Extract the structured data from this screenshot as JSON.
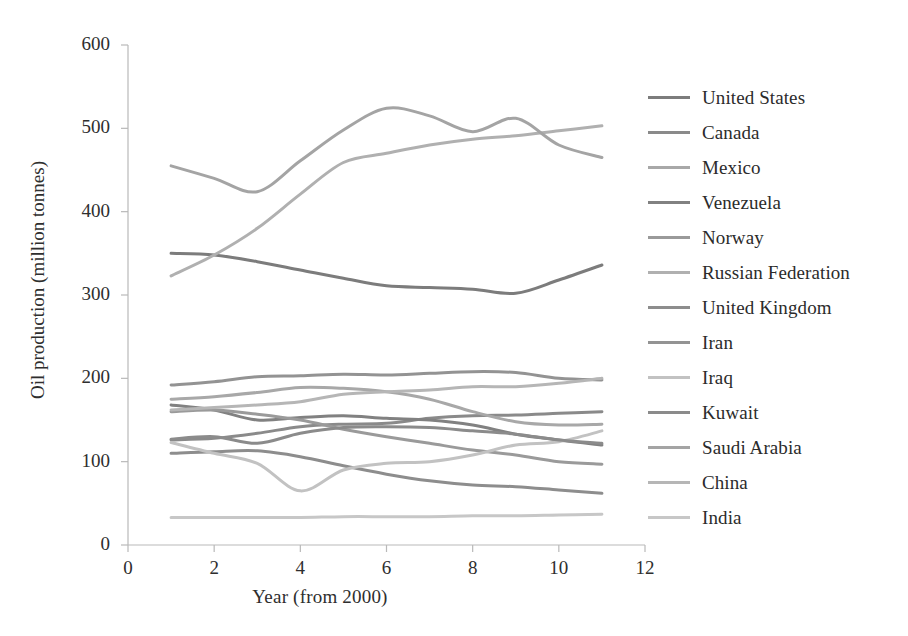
{
  "chart_data": {
    "type": "line",
    "title": "",
    "subtitle": "",
    "xlabel": "Year (from 2000)",
    "ylabel": "Oil production (million tonnes)",
    "xlim": [
      0,
      12
    ],
    "ylim": [
      0,
      600
    ],
    "xticks": [
      0,
      2,
      4,
      6,
      8,
      10,
      12
    ],
    "yticks": [
      0,
      100,
      200,
      300,
      400,
      500,
      600
    ],
    "grid": false,
    "legend_position": "right",
    "x": [
      1,
      2,
      3,
      4,
      5,
      6,
      7,
      8,
      9,
      10,
      11
    ],
    "series": [
      {
        "name": "United States",
        "color": "#7c7c7c",
        "values": [
          350,
          348,
          340,
          330,
          320,
          311,
          309,
          307,
          302,
          318,
          336
        ]
      },
      {
        "name": "Canada",
        "color": "#8a8a8a",
        "values": [
          126,
          128,
          134,
          142,
          145,
          146,
          152,
          155,
          156,
          158,
          160
        ]
      },
      {
        "name": "Mexico",
        "color": "#a8a8a8",
        "values": [
          175,
          178,
          183,
          189,
          188,
          184,
          175,
          160,
          148,
          144,
          145
        ]
      },
      {
        "name": "Venezuela",
        "color": "#818181",
        "values": [
          168,
          162,
          150,
          153,
          155,
          152,
          150,
          144,
          133,
          126,
          120
        ]
      },
      {
        "name": "Norway",
        "color": "#9a9a9a",
        "values": [
          160,
          162,
          157,
          150,
          139,
          130,
          122,
          114,
          108,
          100,
          97
        ]
      },
      {
        "name": "Russian Federation",
        "color": "#b0b0b0",
        "values": [
          323,
          348,
          380,
          421,
          459,
          470,
          480,
          487,
          491,
          497,
          503
        ]
      },
      {
        "name": "United Kingdom",
        "color": "#8d8d8d",
        "values": [
          110,
          112,
          113,
          106,
          95,
          85,
          77,
          72,
          70,
          66,
          62
        ]
      },
      {
        "name": "Iran",
        "color": "#939393",
        "values": [
          192,
          196,
          202,
          203,
          205,
          204,
          206,
          208,
          207,
          200,
          198
        ]
      },
      {
        "name": "Iraq",
        "color": "#c2c2c2",
        "values": [
          123,
          110,
          98,
          65,
          90,
          98,
          100,
          108,
          120,
          124,
          137
        ]
      },
      {
        "name": "Kuwait",
        "color": "#8b8b8b",
        "values": [
          127,
          130,
          122,
          134,
          141,
          142,
          141,
          137,
          133,
          126,
          122
        ]
      },
      {
        "name": "Saudi Arabia",
        "color": "#a4a4a4",
        "values": [
          455,
          440,
          424,
          461,
          498,
          524,
          515,
          496,
          512,
          480,
          465
        ]
      },
      {
        "name": "China",
        "color": "#b6b6b6",
        "values": [
          162,
          165,
          168,
          172,
          181,
          184,
          186,
          190,
          190,
          194,
          200
        ]
      },
      {
        "name": "India",
        "color": "#c7c7c7",
        "values": [
          33,
          33,
          33,
          33,
          34,
          34,
          34,
          35,
          35,
          36,
          37
        ]
      }
    ]
  },
  "axes": {
    "ytick_labels": [
      "0",
      "100",
      "200",
      "300",
      "400",
      "500",
      "600"
    ],
    "xtick_labels": [
      "0",
      "2",
      "4",
      "6",
      "8",
      "10",
      "12"
    ]
  }
}
